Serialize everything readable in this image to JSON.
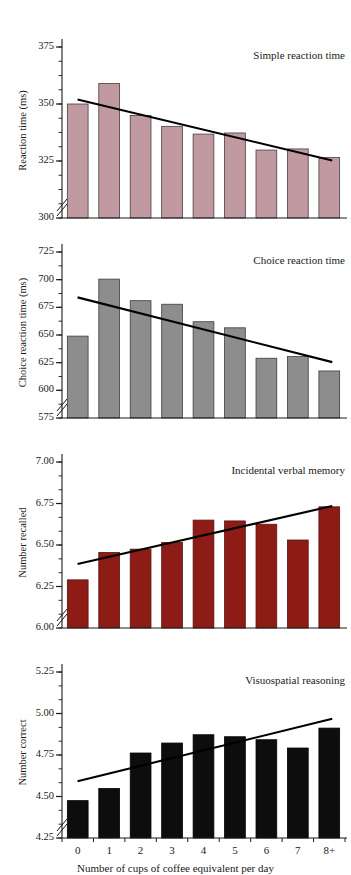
{
  "figure": {
    "xlabel": "Number of cups of coffee equivalent per day",
    "categories": [
      "0",
      "1",
      "2",
      "3",
      "4",
      "5",
      "6",
      "7",
      "8+"
    ],
    "background": "#ffffff",
    "axis_color": "#1a1a1a",
    "trend_color": "#000000"
  },
  "chart_data": [
    {
      "type": "bar",
      "title": "Simple reaction time",
      "xlabel": "",
      "ylabel": "Reaction time (ms)",
      "categories": [
        "0",
        "1",
        "2",
        "3",
        "4",
        "5",
        "6",
        "7",
        "8+"
      ],
      "values": [
        350.0,
        359.0,
        345.0,
        340.2,
        336.8,
        337.3,
        329.8,
        330.3,
        326.5
      ],
      "ylim": [
        300,
        375
      ],
      "yticks": [
        300,
        325,
        350,
        375
      ],
      "ytick_labels": [
        "300",
        "325",
        "350",
        "375"
      ],
      "minor_tick_step": 6.25,
      "axis_break": true,
      "bar_color": "#c09aa0",
      "bar_edge": "#4a3d40",
      "grid": false,
      "legend": null,
      "trendline": {
        "y_start": 352.0,
        "y_end": 325.2,
        "x_start_frac": 0.055,
        "x_end_frac": 0.955
      }
    },
    {
      "type": "bar",
      "title": "Choice reaction time",
      "xlabel": "",
      "ylabel": "Choice reaction time (ms)",
      "categories": [
        "0",
        "1",
        "2",
        "3",
        "4",
        "5",
        "6",
        "7",
        "8+"
      ],
      "values": [
        649.0,
        700.5,
        681.0,
        677.8,
        662.0,
        656.5,
        629.0,
        630.5,
        617.5
      ],
      "ylim": [
        575,
        725
      ],
      "yticks": [
        575,
        600,
        625,
        650,
        675,
        700,
        725
      ],
      "ytick_labels": [
        "575",
        "600",
        "625",
        "650",
        "675",
        "700",
        "725"
      ],
      "minor_tick_step": 12.5,
      "axis_break": true,
      "bar_color": "#8d8d8d",
      "bar_edge": "#3d3d3d",
      "grid": false,
      "legend": null,
      "trendline": {
        "y_start": 684.0,
        "y_end": 625.5,
        "x_start_frac": 0.055,
        "x_end_frac": 0.955
      }
    },
    {
      "type": "bar",
      "title": "Incidental verbal memory",
      "xlabel": "",
      "ylabel": "Number recalled",
      "categories": [
        "0",
        "1",
        "2",
        "3",
        "4",
        "5",
        "6",
        "7",
        "8+"
      ],
      "values": [
        6.29,
        6.455,
        6.475,
        6.515,
        6.65,
        6.645,
        6.625,
        6.53,
        6.73
      ],
      "ylim": [
        6.0,
        7.0
      ],
      "yticks": [
        6.0,
        6.25,
        6.5,
        6.75,
        7.0
      ],
      "ytick_labels": [
        "6.00",
        "6.25",
        "6.50",
        "6.75",
        "7.00"
      ],
      "minor_tick_step": 0.0833,
      "axis_break": true,
      "bar_color": "#8e1c16",
      "bar_edge": "#5a120e",
      "grid": false,
      "legend": null,
      "trendline": {
        "y_start": 6.385,
        "y_end": 6.735,
        "x_start_frac": 0.055,
        "x_end_frac": 0.955
      }
    },
    {
      "type": "bar",
      "title": "Visuospatial reasoning",
      "xlabel": "Number of cups of coffee equivalent per day",
      "ylabel": "Number correct",
      "categories": [
        "0",
        "1",
        "2",
        "3",
        "4",
        "5",
        "6",
        "7",
        "8+"
      ],
      "values": [
        4.475,
        4.548,
        4.762,
        4.822,
        4.872,
        4.86,
        4.842,
        4.792,
        4.912
      ],
      "ylim": [
        4.25,
        5.25
      ],
      "yticks": [
        4.25,
        4.5,
        4.75,
        5.0,
        5.25
      ],
      "ytick_labels": [
        "4.25",
        "4.50",
        "4.75",
        "5.00",
        "5.25"
      ],
      "minor_tick_step": 0.0833,
      "axis_break": true,
      "bar_color": "#0d0d0d",
      "bar_edge": "#000000",
      "grid": false,
      "legend": null,
      "trendline": {
        "y_start": 4.592,
        "y_end": 4.968,
        "x_start_frac": 0.055,
        "x_end_frac": 0.955
      }
    }
  ]
}
